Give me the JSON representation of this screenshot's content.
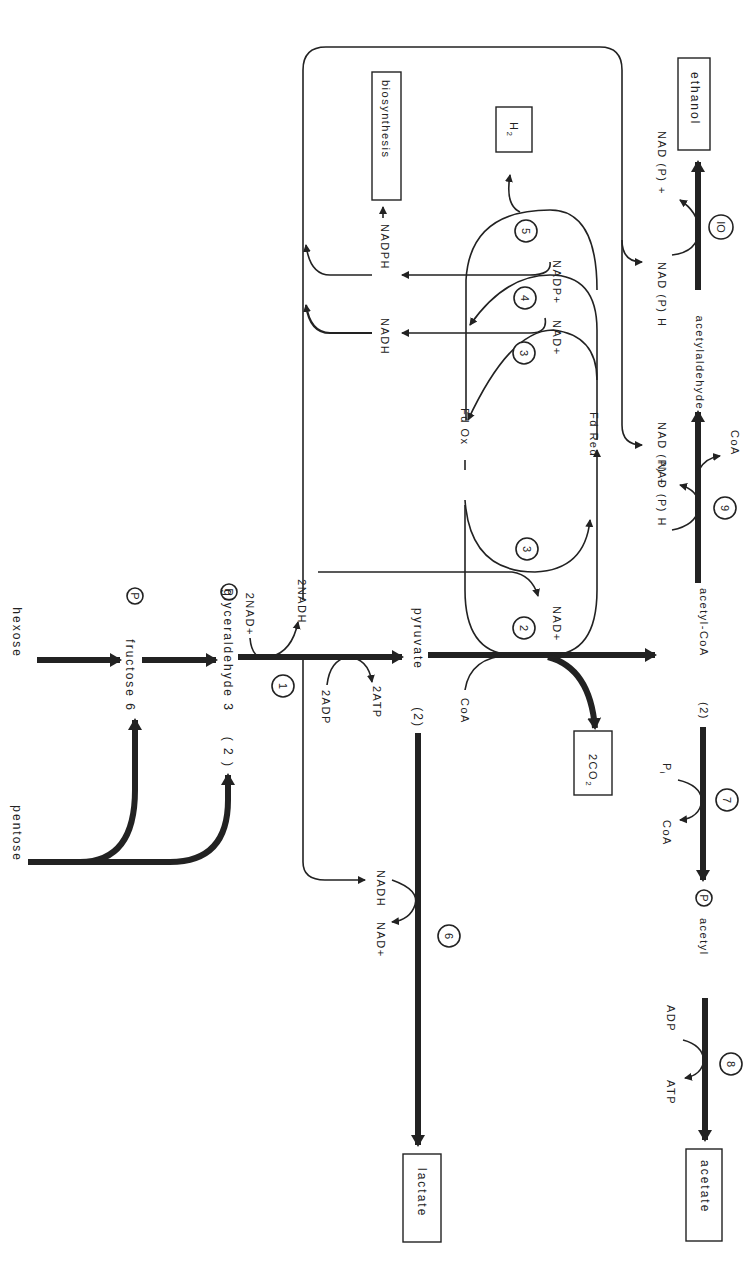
{
  "diagram": {
    "orientation": "rotated 90 degrees clockwise",
    "nodes": {
      "hexose": "hexose",
      "pentose": "pentose",
      "fructose6p": "fructose 6",
      "fructose6p_p": "P",
      "two_g3p_prefix": "( 2 )",
      "g3p": "glyceraldehyde 3",
      "g3p_p": "P",
      "two_nad_plus": "2NAD+",
      "two_nadh": "2NADH",
      "two_adp": "2ADP",
      "two_atp": "2ATP",
      "pyruvate": "pyruvate",
      "two_pyruvate_prefix": "(2)",
      "coa_in": "CoA",
      "co2": "2CO",
      "co2_sub": "2",
      "nad_plus_2": "NAD+",
      "fd_ox": "Fd Ox",
      "fd_red": "Fd Red",
      "nadh_top": "NADH",
      "nadph_top": "NADPH",
      "biosynthesis": "biosynthesis",
      "h2": "H",
      "h2_sub": "2",
      "nad_plus_4": "NAD+",
      "nadp_plus_5": "NADP+",
      "nadh_6": "NADH",
      "nad_plus_6": "NAD+",
      "lactate": "lactate",
      "acetyl_coa": "acetyl-CoA",
      "two_acetyl_coa_prefix": "(2)",
      "pi": "P",
      "pi_sub": "i",
      "coa_out_7": "CoA",
      "acetyl_p": "acetyl",
      "acetyl_p_p": "P",
      "adp_8": "ADP",
      "atp_8": "ATP",
      "acetate": "acetate",
      "nadph_9": "NAD (P) H",
      "nadp_9": "NAD (P) +",
      "coa_out_9": "CoA",
      "acetaldehyde": "acetylaldehyde",
      "nadph_10": "NAD (P) H",
      "nadp_10": "NAD (P) +",
      "ethanol": "ethanol"
    },
    "enzymes": [
      "1",
      "2",
      "3",
      "3",
      "4",
      "5",
      "6",
      "7",
      "8",
      "9",
      "IO"
    ],
    "products_boxed": [
      "biosynthesis",
      "H2",
      "ethanol",
      "lactate",
      "2CO2",
      "acetate"
    ]
  }
}
